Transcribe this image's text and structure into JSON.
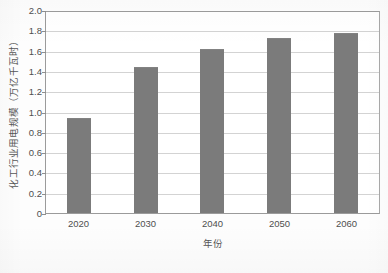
{
  "chart_data": {
    "type": "bar",
    "title": "",
    "subtitle": "",
    "categories": [
      "2020",
      "2030",
      "2040",
      "2050",
      "2060"
    ],
    "values": [
      0.94,
      1.44,
      1.62,
      1.72,
      1.77
    ],
    "series": [
      {
        "name": "化工行业用电规模",
        "values": [
          0.94,
          1.44,
          1.62,
          1.72,
          1.77
        ]
      }
    ],
    "xlabel": "年份",
    "ylabel": "化工行业用电规模（万亿千瓦时）",
    "ylim": [
      0,
      2.0
    ],
    "yticks": [
      "0",
      "0.2",
      "0.4",
      "0.6",
      "0.8",
      "1.0",
      "1.2",
      "1.4",
      "1.6",
      "1.8",
      "2.0"
    ],
    "ytick_values": [
      0,
      0.2,
      0.4,
      0.6,
      0.8,
      1.0,
      1.2,
      1.4,
      1.6,
      1.8,
      2.0
    ],
    "grid": "horizontal",
    "legend": "none",
    "bar_color": "#7b7b7b",
    "gridline_color": "#d3d3d3",
    "axis_color": "#9b9b9b",
    "background_color": "#ffffff",
    "annotations": []
  }
}
